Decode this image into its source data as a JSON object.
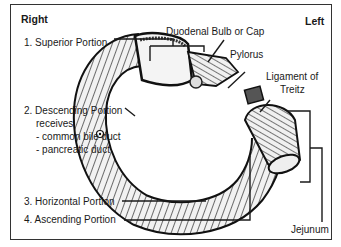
{
  "diagram": {
    "title_left": "Right",
    "title_right": "Left",
    "labels": {
      "superior": "1. Superior Portion",
      "descending": "2. Descending Portion",
      "receives": "receives",
      "bile_duct": "- common bile duct",
      "pancreatic_duct": "- pancreatic duct",
      "horizontal": "3. Horizontal Portion",
      "ascending": "4. Ascending Portion",
      "bulb": "Duodenal Bulb or Cap",
      "pylorus": "Pylorus",
      "ligament_1": "Ligament of",
      "ligament_2": "Treitz",
      "jejunum": "Jejunum"
    },
    "colors": {
      "line": "#1a1a1a",
      "border": "#333333",
      "background": "#ffffff"
    }
  }
}
